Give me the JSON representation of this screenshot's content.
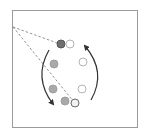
{
  "diagram": {
    "frame": {
      "x": 12,
      "y": 10,
      "width": 126,
      "height": 118,
      "stroke": "#9a9a9a"
    },
    "origin_point": {
      "x": 13,
      "y": 27
    },
    "dashed_lines": [
      {
        "from": [
          13,
          27
        ],
        "to": [
          60,
          44
        ]
      },
      {
        "from": [
          13,
          27
        ],
        "to": [
          74,
          102
        ]
      }
    ],
    "circles": [
      {
        "cx": 61,
        "cy": 44,
        "r": 4,
        "fill": "#6f6f6f",
        "stroke": "#555555"
      },
      {
        "cx": 70,
        "cy": 44,
        "r": 4,
        "fill": "#ffffff",
        "stroke": "#b5b5b5"
      },
      {
        "cx": 54,
        "cy": 64,
        "r": 4,
        "fill": "#a9a9a9",
        "stroke": "#a0a0a0"
      },
      {
        "cx": 83,
        "cy": 62,
        "r": 4,
        "fill": "#ffffff",
        "stroke": "#b5b5b5"
      },
      {
        "cx": 53,
        "cy": 89,
        "r": 4,
        "fill": "#a9a9a9",
        "stroke": "#a0a0a0"
      },
      {
        "cx": 82,
        "cy": 89,
        "r": 4,
        "fill": "#ffffff",
        "stroke": "#b5b5b5"
      },
      {
        "cx": 65,
        "cy": 101,
        "r": 4,
        "fill": "#a9a9a9",
        "stroke": "#a0a0a0"
      },
      {
        "cx": 75,
        "cy": 103,
        "r": 4,
        "fill": "#f2f2f2",
        "stroke": "#6a6a6a"
      }
    ],
    "arrows": [
      {
        "name": "left-arc-arrow",
        "direction": "down",
        "path": "M49 50 Q33 78 53 104"
      },
      {
        "name": "right-arc-arrow",
        "direction": "up",
        "path": "M91 100 Q107 72 85 46"
      }
    ],
    "colors": {
      "line": "#333333",
      "dash": "#777777",
      "frame": "#9a9a9a"
    }
  }
}
